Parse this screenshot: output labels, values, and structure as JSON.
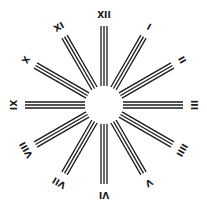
{
  "diagram": {
    "title": "",
    "center": {
      "x": 104,
      "y": 105
    },
    "inner_radius": 19,
    "outer_radius": 79,
    "label_radius": 90,
    "line_color": "#1a1a1a",
    "background": "#ffffff",
    "lines_per_ray": 3,
    "rays": [
      {
        "label": "XII",
        "angle": 0
      },
      {
        "label": "I",
        "angle": 30
      },
      {
        "label": "II",
        "angle": 60
      },
      {
        "label": "III",
        "angle": 90
      },
      {
        "label": "IIII",
        "angle": 120
      },
      {
        "label": "V",
        "angle": 150
      },
      {
        "label": "VI",
        "angle": 180
      },
      {
        "label": "VII",
        "angle": 210
      },
      {
        "label": "VIII",
        "angle": 240
      },
      {
        "label": "IX",
        "angle": 270
      },
      {
        "label": "X",
        "angle": 300
      },
      {
        "label": "XI",
        "angle": 330
      }
    ]
  }
}
